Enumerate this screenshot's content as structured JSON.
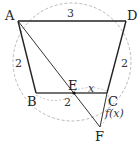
{
  "diagram": {
    "type": "geometry",
    "points": {
      "A": {
        "label": "A",
        "x": 18,
        "y": 21
      },
      "D": {
        "label": "D",
        "x": 126,
        "y": 21
      },
      "B": {
        "label": "B",
        "x": 36,
        "y": 93
      },
      "C": {
        "label": "C",
        "x": 107,
        "y": 93
      },
      "E": {
        "label": "E",
        "x": 74,
        "y": 93
      },
      "F": {
        "label": "F",
        "x": 100,
        "y": 127
      }
    },
    "edges": [
      {
        "from": "A",
        "to": "D",
        "length_label": "3"
      },
      {
        "from": "A",
        "to": "B",
        "length_label": "2"
      },
      {
        "from": "D",
        "to": "C",
        "length_label": "2"
      },
      {
        "from": "B",
        "to": "C",
        "length_label": ""
      },
      {
        "from": "A",
        "to": "F",
        "length_label": ""
      },
      {
        "from": "C",
        "to": "F",
        "length_label": ""
      }
    ],
    "measures": {
      "AD": "3",
      "AB": "2",
      "DC": "2",
      "BE": "2",
      "EC": "x",
      "CF": "f(x)"
    },
    "circle": {
      "cx": 72,
      "cy": 62,
      "r": 59,
      "style": "dashed"
    }
  }
}
